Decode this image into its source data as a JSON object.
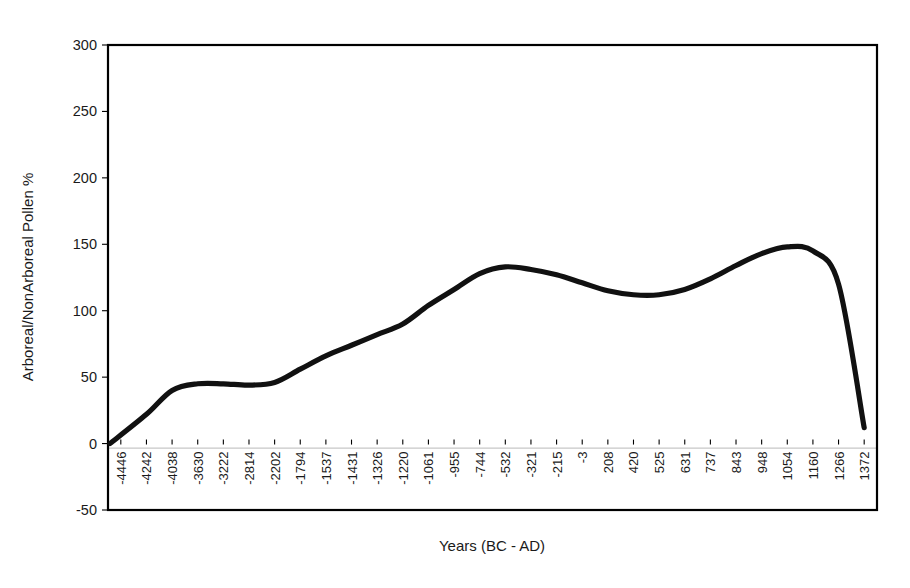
{
  "chart_data": {
    "type": "line",
    "title": "",
    "xlabel": "Years (BC - AD)",
    "ylabel": "Arboreal/NonArboreal Pollen %",
    "ylim": [
      -50,
      300
    ],
    "ytick_values": [
      -50,
      0,
      50,
      100,
      150,
      200,
      250,
      300
    ],
    "ytick_labels": [
      "-50",
      "0",
      "50",
      "100",
      "150",
      "200",
      "250",
      "300"
    ],
    "grid": false,
    "legend": "none",
    "categories": [
      "-4446",
      "-4242",
      "-4038",
      "-3630",
      "-3222",
      "-2814",
      "-2202",
      "-1794",
      "-1537",
      "-1431",
      "-1326",
      "-1220",
      "-1061",
      "-955",
      "-744",
      "-532",
      "-321",
      "-215",
      "-3",
      "208",
      "420",
      "525",
      "631",
      "737",
      "843",
      "948",
      "1054",
      "1160",
      "1266",
      "1372"
    ],
    "series": [
      {
        "name": "Arboreal/NonArboreal Pollen %",
        "values": [
          0,
          22,
          40,
          45,
          45,
          44,
          46,
          56,
          66,
          74,
          82,
          90,
          104,
          116,
          128,
          133,
          131,
          127,
          121,
          115,
          112,
          112,
          116,
          124,
          134,
          143,
          148,
          145,
          120,
          12
        ]
      }
    ],
    "annotations": []
  },
  "axis": {
    "x_title": "Years (BC - AD)",
    "y_title": "Arboreal/NonArboreal Pollen %"
  }
}
